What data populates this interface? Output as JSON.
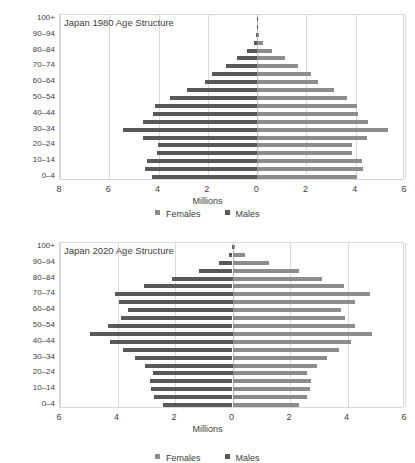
{
  "axis_title": "Millions",
  "legend": {
    "female_label": "Females",
    "female_color": "#8c8c8c",
    "male_label": "Males",
    "male_color": "#595959"
  },
  "age_labels_all": [
    "0–4",
    "5–9",
    "10–14",
    "15–19",
    "20–24",
    "25–29",
    "30–34",
    "35–39",
    "40–44",
    "45–49",
    "50–54",
    "55–59",
    "60–64",
    "65–69",
    "70–74",
    "75–79",
    "80–84",
    "85–89",
    "90–94",
    "95–99",
    "100+"
  ],
  "age_labels_shown": [
    "0–4",
    "10–14",
    "20–24",
    "30–34",
    "40–44",
    "50–54",
    "60–64",
    "70–74",
    "80–84",
    "90–94",
    "100+"
  ],
  "chart_data": [
    {
      "type": "bar",
      "subtype": "population-pyramid",
      "title": "Japan 1980 Age Structure",
      "xlabel": "Millions",
      "ylabel": "",
      "xlim": [
        -8,
        6
      ],
      "xticks": [
        8,
        6,
        4,
        2,
        0,
        2,
        4,
        6
      ],
      "xtick_values": [
        -8,
        -6,
        -4,
        -2,
        0,
        2,
        4,
        6
      ],
      "grid": true,
      "legend_position": "bottom",
      "categories": [
        "0–4",
        "5–9",
        "10–14",
        "15–19",
        "20–24",
        "25–29",
        "30–34",
        "35–39",
        "40–44",
        "45–49",
        "50–54",
        "55–59",
        "60–64",
        "65–69",
        "70–74",
        "75–79",
        "80–84",
        "85–89",
        "90–94",
        "95–99",
        "100+"
      ],
      "series": [
        {
          "name": "Females",
          "direction": "right",
          "values": [
            4.05,
            4.3,
            4.25,
            3.85,
            3.85,
            4.45,
            5.3,
            4.5,
            4.1,
            4.05,
            3.65,
            3.1,
            2.45,
            2.2,
            1.65,
            1.15,
            0.62,
            0.25,
            0.07,
            0.01,
            0.002
          ]
        },
        {
          "name": "Males",
          "direction": "left",
          "values": [
            4.28,
            4.55,
            4.48,
            4.05,
            4.02,
            4.62,
            5.45,
            4.65,
            4.22,
            4.15,
            3.55,
            2.85,
            2.12,
            1.82,
            1.28,
            0.82,
            0.4,
            0.14,
            0.03,
            0.004,
            0.001
          ]
        }
      ]
    },
    {
      "type": "bar",
      "subtype": "population-pyramid",
      "title": "Japan 2020 Age Structure",
      "xlabel": "Millions",
      "ylabel": "",
      "xlim": [
        -6,
        6
      ],
      "xticks": [
        6,
        4,
        2,
        0,
        2,
        4,
        6
      ],
      "xtick_values": [
        -6,
        -4,
        -2,
        0,
        2,
        4,
        6
      ],
      "grid": true,
      "legend_position": "bottom",
      "categories": [
        "0–4",
        "5–9",
        "10–14",
        "15–19",
        "20–24",
        "25–29",
        "30–34",
        "35–39",
        "40–44",
        "45–49",
        "50–54",
        "55–59",
        "60–64",
        "65–69",
        "70–74",
        "75–79",
        "80–84",
        "85–89",
        "90–94",
        "95–99",
        "100+"
      ],
      "series": [
        {
          "name": "Females",
          "direction": "right",
          "values": [
            2.3,
            2.58,
            2.68,
            2.72,
            2.6,
            2.95,
            3.28,
            3.72,
            4.12,
            4.85,
            4.25,
            3.92,
            3.78,
            4.25,
            4.78,
            3.88,
            3.12,
            2.32,
            1.28,
            0.42,
            0.07
          ]
        },
        {
          "name": "Males",
          "direction": "left",
          "values": [
            2.42,
            2.72,
            2.82,
            2.88,
            2.75,
            3.05,
            3.38,
            3.82,
            4.25,
            4.95,
            4.32,
            3.88,
            3.65,
            3.95,
            4.1,
            3.08,
            2.1,
            1.18,
            0.48,
            0.12,
            0.012
          ]
        }
      ]
    }
  ]
}
